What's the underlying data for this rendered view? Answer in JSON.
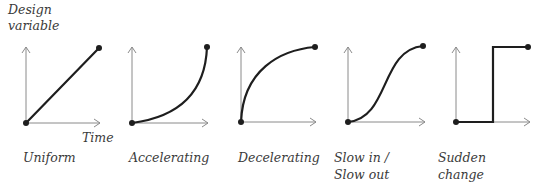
{
  "axis_labels": {
    "y_line1": "Design",
    "y_line2": "variable",
    "x": "Time"
  },
  "panels": [
    {
      "id": "uniform",
      "label_line1": "Uniform",
      "label_line2": ""
    },
    {
      "id": "accelerating",
      "label_line1": "Accelerating",
      "label_line2": ""
    },
    {
      "id": "decelerating",
      "label_line1": "Decelerating",
      "label_line2": ""
    },
    {
      "id": "slow-in-slow-out",
      "label_line1": "Slow in /",
      "label_line2": "Slow out"
    },
    {
      "id": "sudden-change",
      "label_line1": "Sudden",
      "label_line2": "change"
    }
  ],
  "colors": {
    "curve": "#1e1e1e",
    "axis": "#8a8a8a",
    "text": "#3a3a3a"
  }
}
